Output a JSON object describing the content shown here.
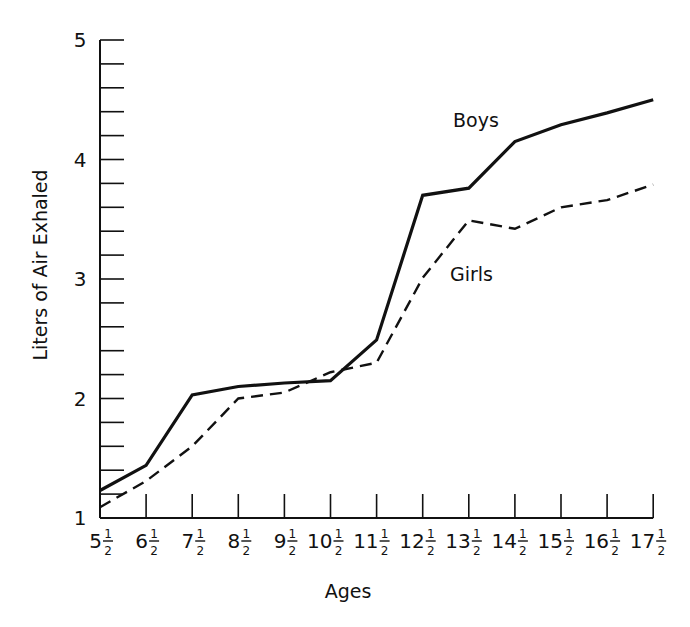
{
  "chart_data": {
    "type": "line",
    "title": "",
    "xlabel": "Ages",
    "ylabel": "Liters of Air Exhaled",
    "ylim": [
      1,
      5
    ],
    "yticks_major": [
      1,
      2,
      3,
      4,
      5
    ],
    "ytick_minor_step": 0.2,
    "categories": [
      "5½",
      "6½",
      "7½",
      "8½",
      "9½",
      "10½",
      "11½",
      "12½",
      "13½",
      "14½",
      "15½",
      "16½",
      "17½"
    ],
    "category_whole": [
      "5",
      "6",
      "7",
      "8",
      "9",
      "10",
      "11",
      "12",
      "13",
      "14",
      "15",
      "16",
      "17"
    ],
    "x": [
      5.5,
      6.5,
      7.5,
      8.5,
      9.5,
      10.5,
      11.5,
      12.5,
      13.5,
      14.5,
      15.5,
      16.5,
      17.5
    ],
    "series": [
      {
        "name": "Boys",
        "style": "solid",
        "values": [
          1.23,
          1.44,
          2.03,
          2.1,
          2.13,
          2.15,
          2.49,
          3.7,
          3.76,
          4.15,
          4.29,
          4.39,
          4.5
        ]
      },
      {
        "name": "Girls",
        "style": "dashed",
        "values": [
          1.09,
          1.31,
          1.6,
          2.0,
          2.05,
          2.22,
          2.3,
          3.01,
          3.49,
          3.42,
          3.6,
          3.66,
          3.79
        ]
      }
    ],
    "annotations": [
      {
        "text": "Boys",
        "x": 14.2,
        "y": 4.6
      },
      {
        "text": "Girls",
        "x": 14.1,
        "y": 3.3
      }
    ],
    "grid": false,
    "legend": "inline labels"
  },
  "labels": {
    "x_axis_title": "Ages",
    "y_axis_title": "Liters of Air Exhaled",
    "boys": "Boys",
    "girls": "Girls",
    "frac_num": "1",
    "frac_den": "2"
  }
}
